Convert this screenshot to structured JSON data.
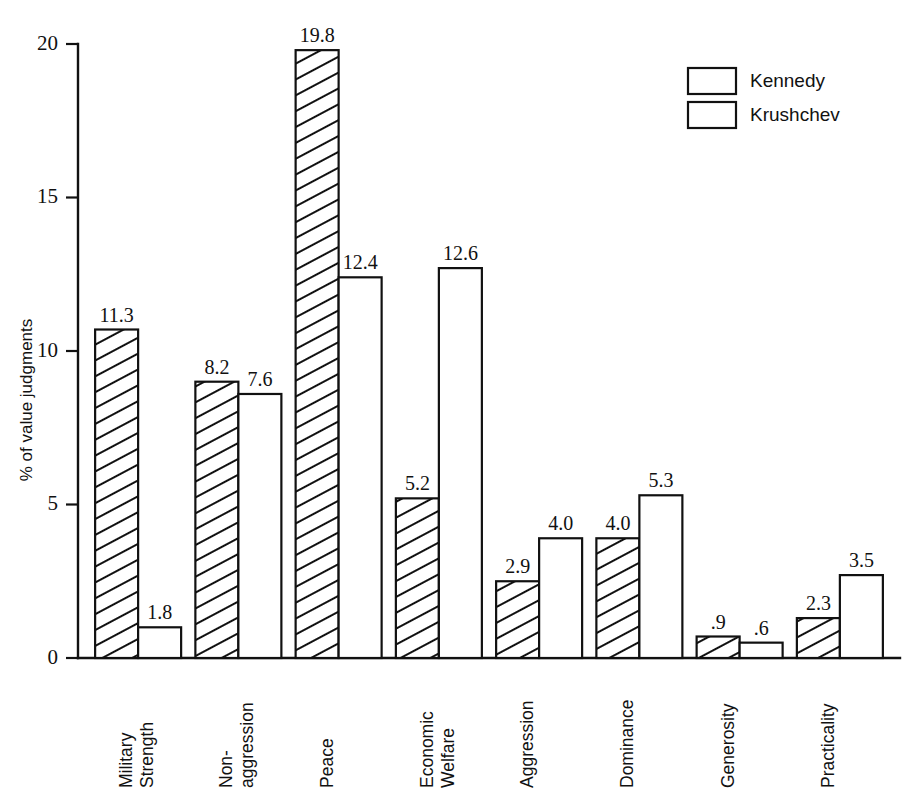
{
  "chart_data": {
    "type": "bar",
    "title": "",
    "subtitle": "",
    "xlabel": "",
    "ylabel": "% of value judgments",
    "ylim": [
      0,
      20
    ],
    "yticks": [
      0,
      5,
      10,
      15,
      20
    ],
    "ytick_labels": [
      "0",
      "5",
      "10",
      "15",
      "20"
    ],
    "grid": false,
    "legend_position": "top-right",
    "categories": [
      "Military Strength",
      "Non-aggression",
      "Peace",
      "Economic Welfare",
      "Aggression",
      "Dominance",
      "Generosity",
      "Practicality"
    ],
    "category_lines": [
      [
        "Military",
        "Strength"
      ],
      [
        "Non-",
        "aggression"
      ],
      [
        "Peace"
      ],
      [
        "Economic",
        "Welfare"
      ],
      [
        "Aggression"
      ],
      [
        "Dominance"
      ],
      [
        "Generosity"
      ],
      [
        "Practicality"
      ]
    ],
    "series": [
      {
        "name": "Kennedy",
        "fill": "hatched",
        "values": [
          11.3,
          8.2,
          19.8,
          5.2,
          2.9,
          4.0,
          0.9,
          2.3
        ],
        "labels": [
          "11.3",
          "8.2",
          "19.8",
          "5.2",
          "2.9",
          "4.0",
          ".9",
          "2.3"
        ],
        "drawn_heights": [
          10.7,
          9.0,
          19.8,
          5.2,
          2.5,
          3.9,
          0.7,
          1.3
        ]
      },
      {
        "name": "Krushchev",
        "fill": "empty",
        "values": [
          1.8,
          7.6,
          12.4,
          12.6,
          4.0,
          5.3,
          0.6,
          3.5
        ],
        "labels": [
          "1.8",
          "7.6",
          "12.4",
          "12.6",
          "4.0",
          "5.3",
          ".6",
          "3.5"
        ],
        "drawn_heights": [
          1.0,
          8.6,
          12.4,
          12.7,
          3.9,
          5.3,
          0.5,
          2.7
        ]
      }
    ],
    "colors": {
      "ink": "#111111",
      "background": "#ffffff",
      "kennedy_fill": "#ffffff",
      "krushchev_fill": "#ffffff"
    }
  },
  "legend": {
    "items": [
      {
        "label": "Kennedy",
        "pattern": "hatched"
      },
      {
        "label": "Krushchev",
        "pattern": "empty"
      }
    ]
  },
  "axis": {
    "y_title": "% of value judgments",
    "tick_0": "0",
    "tick_5": "5",
    "tick_10": "10",
    "tick_15": "15",
    "tick_20": "20"
  }
}
